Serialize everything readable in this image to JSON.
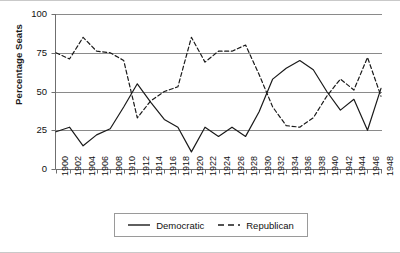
{
  "chart_data": {
    "type": "line",
    "title": "",
    "xlabel": "",
    "ylabel": "Percentage Seats",
    "ylim": [
      0,
      100
    ],
    "yticks": [
      0,
      25,
      50,
      75,
      100
    ],
    "grid": true,
    "legend_position": "bottom",
    "x": [
      1900,
      1902,
      1904,
      1906,
      1908,
      1910,
      1912,
      1914,
      1916,
      1918,
      1920,
      1922,
      1924,
      1926,
      1928,
      1930,
      1932,
      1934,
      1936,
      1938,
      1940,
      1942,
      1944,
      1946,
      1948
    ],
    "xticklabels": [
      "1900",
      "1902",
      "1904",
      "1906",
      "1908",
      "1910",
      "1912",
      "1914",
      "1916",
      "1918",
      "1920",
      "1922",
      "1924",
      "1926",
      "1928",
      "1930",
      "1932",
      "1934",
      "1936",
      "1938",
      "1940",
      "1942",
      "1944",
      "1946",
      "1948"
    ],
    "series": [
      {
        "name": "Democratic",
        "style": "solid",
        "color": "#1a1a1a",
        "values": [
          24,
          27,
          15,
          22,
          26,
          40,
          55,
          43,
          32,
          27,
          11,
          27,
          21,
          27,
          21,
          37,
          58,
          65,
          70,
          64,
          50,
          38,
          45,
          25,
          52
        ]
      },
      {
        "name": "Republican",
        "style": "dashed",
        "color": "#1a1a1a",
        "values": [
          75,
          71,
          85,
          76,
          75,
          70,
          33,
          44,
          50,
          53,
          85,
          69,
          76,
          76,
          80,
          61,
          40,
          28,
          27,
          33,
          47,
          58,
          51,
          72,
          47
        ]
      }
    ]
  },
  "axis": {
    "y_label": "Percentage Seats",
    "y_ticks": [
      "0",
      "25",
      "50",
      "75",
      "100"
    ]
  },
  "legend": {
    "items": [
      {
        "label": "Democratic",
        "style": "solid"
      },
      {
        "label": "Republican",
        "style": "dashed"
      }
    ]
  }
}
